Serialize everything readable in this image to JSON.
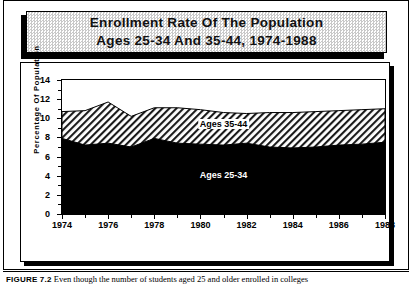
{
  "figure": {
    "title_line1": "Enrollment Rate Of The Population",
    "title_line2": "Ages 25-34 And 35-44, 1974-1988",
    "caption_label": "FIGURE 7.2",
    "caption_text": "Even though the number of students aged 25 and older enrolled in colleges"
  },
  "chart_data": {
    "type": "area",
    "title": "Enrollment Rate Of The Population Ages 25-34 And 35-44, 1974-1988",
    "xlabel": "",
    "ylabel": "Percentage Of Population",
    "stacked": true,
    "grid": false,
    "legend": "inline-labels",
    "xlim": [
      1974,
      1988
    ],
    "ylim": [
      0,
      14
    ],
    "yticks": [
      0,
      2,
      4,
      6,
      8,
      10,
      12,
      14
    ],
    "xticks": [
      1974,
      1976,
      1978,
      1980,
      1982,
      1984,
      1986,
      1988
    ],
    "xtick_labels": [
      "1974",
      "1976",
      "1978",
      "1980",
      "1982",
      "1984",
      "1986",
      "1988"
    ],
    "ytick_labels": [
      "0",
      "2",
      "4",
      "6",
      "8",
      "10",
      "12",
      "14"
    ],
    "x": [
      1974,
      1975,
      1976,
      1977,
      1978,
      1979,
      1980,
      1981,
      1982,
      1983,
      1984,
      1985,
      1986,
      1987,
      1988
    ],
    "series": [
      {
        "name": "Ages 25-34",
        "fill": "#000000",
        "values": [
          7.9,
          7.2,
          7.4,
          7.0,
          7.9,
          7.4,
          7.3,
          7.2,
          7.4,
          7.0,
          6.9,
          7.0,
          7.2,
          7.3,
          7.5
        ]
      },
      {
        "name": "Ages 35-44",
        "fill": "hatched-diagonal",
        "values": [
          2.8,
          3.6,
          4.3,
          3.2,
          3.2,
          3.7,
          3.6,
          3.4,
          3.1,
          3.6,
          3.7,
          3.7,
          3.6,
          3.6,
          3.5
        ]
      }
    ],
    "totals": [
      10.7,
      10.8,
      11.7,
      10.2,
      11.1,
      11.1,
      10.9,
      10.6,
      10.5,
      10.6,
      10.6,
      10.7,
      10.8,
      10.9,
      11.0
    ],
    "annotations": [
      {
        "text": "Ages 35-44",
        "x": 1981,
        "y": 9.4
      },
      {
        "text": "Ages 25-34",
        "x": 1981,
        "y": 4.1
      }
    ]
  },
  "colors": {
    "ink": "#000000",
    "paper": "#ffffff",
    "title_plate": "#c9c9c9"
  }
}
